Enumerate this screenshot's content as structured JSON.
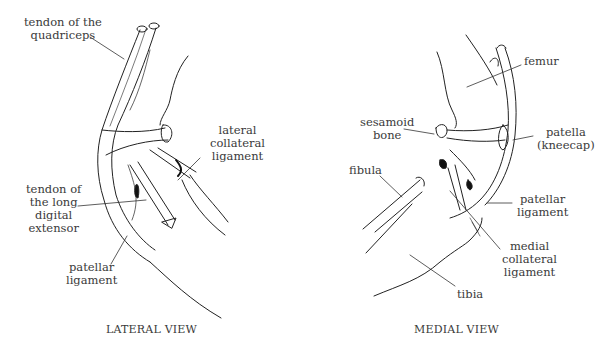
{
  "figure": {
    "views": [
      {
        "caption": "LATERAL VIEW",
        "labels": {
          "quadriceps_tendon": "tendon of the\nquadriceps",
          "lateral_collateral": "lateral\ncollateral\nligament",
          "long_digital_extensor": "tendon of\nthe long\ndigital\nextensor",
          "patellar_ligament": "patellar\nligament"
        }
      },
      {
        "caption": "MEDIAL VIEW",
        "labels": {
          "femur": "femur",
          "sesamoid": "sesamoid\nbone",
          "patella": "patella\n(kneecap)",
          "fibula": "fibula",
          "patellar_ligament": "patellar\nligament",
          "medial_collateral": "medial\ncollateral\nligament",
          "tibia": "tibia"
        }
      }
    ],
    "colors": {
      "ink": "#222222",
      "label": "#3a3a3a",
      "background": "#ffffff"
    }
  }
}
